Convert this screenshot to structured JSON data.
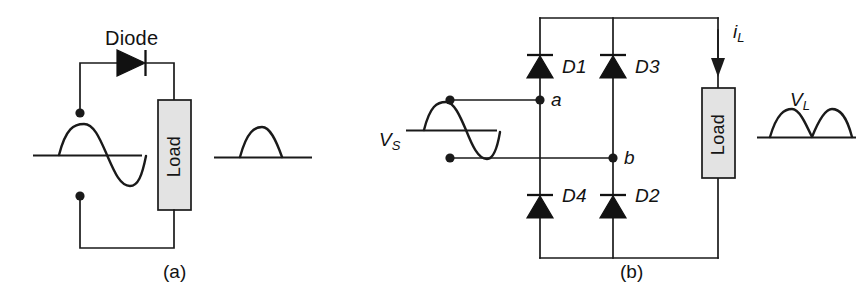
{
  "figure": {
    "background_color": "#ffffff",
    "ink_color": "#1a1a1a",
    "load_fill_color": "#e3e3e3"
  },
  "panel_a": {
    "caption": "(a)",
    "diode_label": "Diode",
    "load_label": "Load",
    "input_waveform": {
      "name": "full sine wave",
      "type": "sine",
      "cycles": 1,
      "description": "one full sine cycle: positive half then negative half"
    },
    "output_waveform": {
      "name": "half-wave rectified",
      "type": "half-wave-rectified",
      "humps": 1,
      "description": "single positive hump followed by flat zero line"
    }
  },
  "panel_b": {
    "caption": "(b)",
    "source_label": "V",
    "source_label_sub": "S",
    "current_label": "i",
    "current_label_sub": "L",
    "output_label": "V",
    "output_label_sub": "L",
    "load_label": "Load",
    "node_labels": [
      "a",
      "b"
    ],
    "diodes": [
      {
        "id": "D1",
        "position": "top-left"
      },
      {
        "id": "D3",
        "position": "top-middle"
      },
      {
        "id": "D4",
        "position": "bottom-left"
      },
      {
        "id": "D2",
        "position": "bottom-middle"
      }
    ],
    "input_waveform": {
      "name": "full sine wave",
      "type": "sine",
      "cycles": 1,
      "description": "one full sine cycle: positive half then negative half"
    },
    "output_waveform": {
      "name": "full-wave rectified",
      "type": "full-wave-rectified",
      "humps": 2,
      "description": "two positive humps, full-wave rectified output"
    }
  }
}
